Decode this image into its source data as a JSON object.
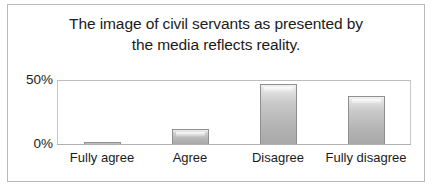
{
  "chart_data": {
    "type": "bar",
    "title": "The image of civil servants as presented by the media reflects reality.",
    "title_lines": [
      "The image of civil servants as presented by",
      "the media reflects reality."
    ],
    "categories": [
      "Fully agree",
      "Agree",
      "Disagree",
      "Fully disagree"
    ],
    "values": [
      1,
      12,
      48,
      38
    ],
    "xlabel": "",
    "ylabel": "",
    "ylim": [
      0,
      50
    ],
    "ytick_labels": [
      "0%",
      "50%"
    ],
    "ytick_values": [
      0,
      50
    ],
    "grid": false,
    "legend": null,
    "series": [
      {
        "name": "Share of respondents",
        "values": [
          1,
          12,
          48,
          38
        ]
      }
    ],
    "colors": {
      "bar_fill_top": "#f2f2f2",
      "bar_fill_bottom": "#a9a9a9",
      "bar_border": "#8f8f8f",
      "plot_border": "#c6c6c6",
      "figure_border": "#b9b9b9",
      "text": "#1b1b1b",
      "background": "#ffffff"
    }
  }
}
